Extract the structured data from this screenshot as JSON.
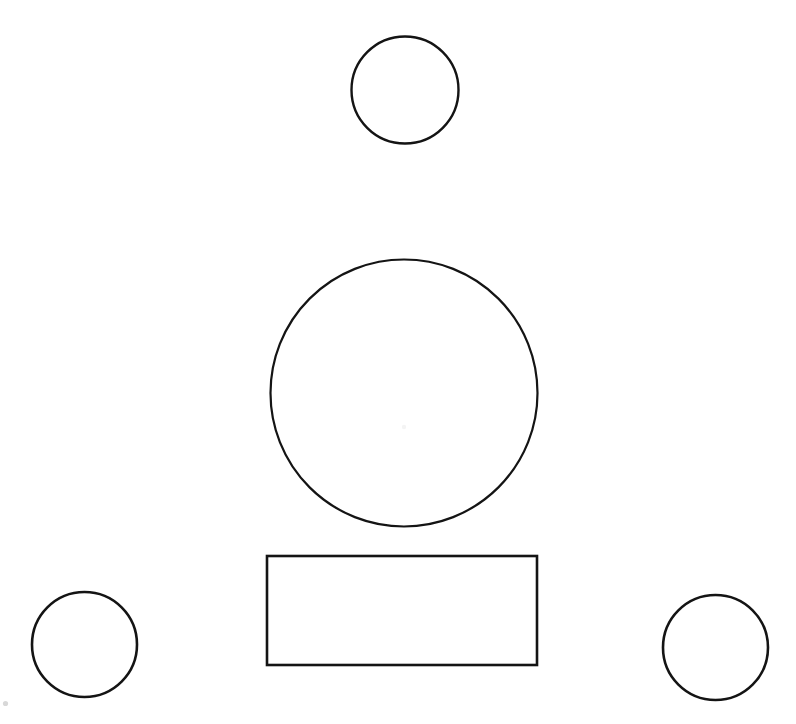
{
  "canvas": {
    "width": 796,
    "height": 724,
    "background_color": "#ffffff",
    "stroke_color": "#141414",
    "title": "Line drawing of circles and a rectangle"
  },
  "shapes": [
    {
      "id": "top-circle",
      "name": "small-circle-top",
      "type": "circle",
      "cx": 405,
      "cy": 90,
      "r": 53.5,
      "stroke": "#141414",
      "stroke_width": 2.4,
      "fill": "none",
      "label": "Top small circle"
    },
    {
      "id": "center-circle",
      "name": "large-circle-center",
      "type": "circle",
      "cx": 404,
      "cy": 393,
      "r": 133.5,
      "stroke": "#141414",
      "stroke_width": 2.2,
      "fill": "none",
      "label": "Large center circle"
    },
    {
      "id": "rectangle",
      "name": "rectangle-bottom-center",
      "type": "rect",
      "x": 267,
      "y": 556,
      "width": 270,
      "height": 109,
      "stroke": "#141414",
      "stroke_width": 2.6,
      "fill": "none",
      "label": "Bottom center rectangle"
    },
    {
      "id": "bottom-left-circle",
      "name": "small-circle-bottom-left",
      "type": "circle",
      "cx": 84.5,
      "cy": 644.5,
      "r": 52.5,
      "stroke": "#141414",
      "stroke_width": 2.6,
      "fill": "none",
      "label": "Bottom left small circle"
    },
    {
      "id": "bottom-right-circle",
      "name": "small-circle-bottom-right",
      "type": "circle",
      "cx": 715.5,
      "cy": 647.5,
      "r": 52.5,
      "stroke": "#141414",
      "stroke_width": 2.6,
      "fill": "none",
      "label": "Bottom right small circle"
    }
  ],
  "marks": [
    {
      "id": "center-speck",
      "name": "faint-center-mark",
      "type": "speck",
      "cx": 404,
      "cy": 427,
      "r": 2.2,
      "fill": "#f4f4f4",
      "label": "Faint mark near center of large circle"
    },
    {
      "id": "corner-speck",
      "name": "faint-corner-mark",
      "type": "speck",
      "cx": 5.5,
      "cy": 703.5,
      "r": 2.6,
      "fill": "#d8d8d8",
      "label": "Faint speck at lower left margin"
    }
  ]
}
